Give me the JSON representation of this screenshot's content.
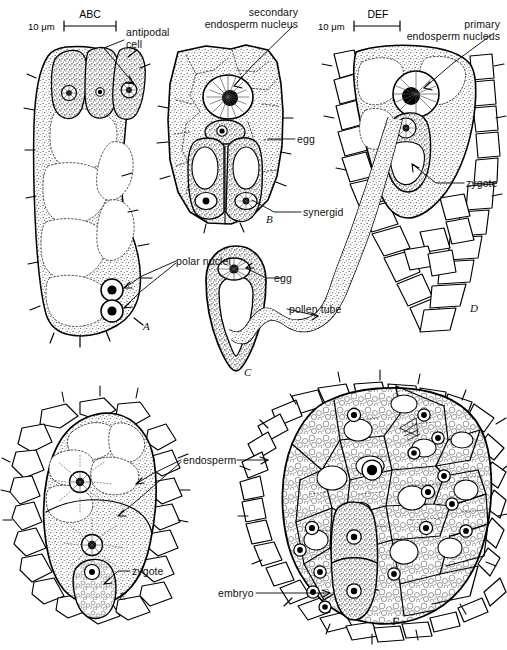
{
  "figure": {
    "kind": "scientific-line-drawing",
    "background_color": "#ffffff",
    "ink_color": "#000000",
    "stipple_color": "#3a3a3a"
  },
  "scale_bars": [
    {
      "id": "scale-abc",
      "name": "ABC",
      "value": "10",
      "unit": "μm",
      "unit_text": "10 μm",
      "x": 64,
      "y": 24,
      "length_px": 52
    },
    {
      "id": "scale-def",
      "name": "DEF",
      "value": "10",
      "unit": "μm",
      "unit_text": "10 μm",
      "x": 354,
      "y": 24,
      "length_px": 46
    }
  ],
  "labels": [
    {
      "id": "antipodal-cell",
      "text": "antipodal\ncell",
      "x": 126,
      "y": 26,
      "align": "left"
    },
    {
      "id": "secondary-endosperm-nucleus",
      "text": "secondary\nendosperm nucleus",
      "x": 298,
      "y": 6,
      "align": "right"
    },
    {
      "id": "primary-endosperm-nucleus",
      "text": "primary\nendosperm nucleus",
      "x": 500,
      "y": 18,
      "align": "right"
    },
    {
      "id": "egg-b",
      "text": "egg",
      "x": 297,
      "y": 134,
      "align": "left"
    },
    {
      "id": "zygote-d",
      "text": "zygote",
      "x": 466,
      "y": 178,
      "align": "left"
    },
    {
      "id": "synergid",
      "text": "synergid",
      "x": 303,
      "y": 207,
      "align": "left"
    },
    {
      "id": "polar-nuclei",
      "text": "polar nuclei",
      "x": 176,
      "y": 255,
      "align": "left"
    },
    {
      "id": "egg-c",
      "text": "egg",
      "x": 274,
      "y": 273,
      "align": "left"
    },
    {
      "id": "pollen-tube",
      "text": "pollen tube",
      "x": 289,
      "y": 304,
      "align": "left"
    },
    {
      "id": "endosperm",
      "text": "endosperm",
      "x": 183,
      "y": 455,
      "align": "left"
    },
    {
      "id": "zygote-e",
      "text": "zygote",
      "x": 132,
      "y": 566,
      "align": "left"
    },
    {
      "id": "embryo",
      "text": "embryo",
      "x": 218,
      "y": 588,
      "align": "left"
    }
  ],
  "panels": [
    {
      "letter": "A",
      "x": 143,
      "y": 320,
      "caption": "Embryo sac with three antipodal cells and two polar nuclei"
    },
    {
      "letter": "B",
      "x": 266,
      "y": 213,
      "caption": "Egg apparatus: secondary endosperm nucleus, egg and two synergids"
    },
    {
      "letter": "C",
      "x": 244,
      "y": 373,
      "caption": "Isolated embryo sac showing the egg"
    },
    {
      "letter": "D",
      "x": 470,
      "y": 305,
      "caption": "Pollen tube discharge, primary endosperm nucleus and zygote"
    },
    {
      "letter": "E",
      "x": 119,
      "y": 592,
      "caption": "Free-nuclear endosperm stage with zygote"
    },
    {
      "letter": "F",
      "x": 392,
      "y": 617,
      "caption": "Cellular endosperm with two-celled embryo"
    }
  ],
  "structures": {
    "antipodal_cell_count": 3,
    "polar_nuclei_count": 2,
    "synergid_count": 2,
    "panel_f_endosperm_nuclei": 18,
    "embryo_cells": 2
  }
}
